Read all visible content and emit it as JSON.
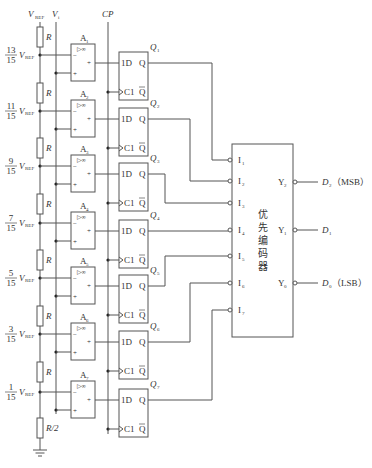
{
  "top_labels": {
    "vref": "V",
    "vref_sub": "REF",
    "vi": "V",
    "vi_sub": "i",
    "cp": "CP"
  },
  "resistor_label": "R",
  "resistor_last_label": "R/2",
  "ref_nodes": [
    {
      "num": "13",
      "den": "15",
      "v": "V",
      "sub": "REF"
    },
    {
      "num": "11",
      "den": "15",
      "v": "V",
      "sub": "REF"
    },
    {
      "num": "9",
      "den": "15",
      "v": "V",
      "sub": "REF"
    },
    {
      "num": "7",
      "den": "15",
      "v": "V",
      "sub": "REF"
    },
    {
      "num": "5",
      "den": "15",
      "v": "V",
      "sub": "REF"
    },
    {
      "num": "3",
      "den": "15",
      "v": "V",
      "sub": "REF"
    },
    {
      "num": "1",
      "den": "15",
      "v": "V",
      "sub": "REF"
    }
  ],
  "comparators": [
    {
      "name": "A",
      "sub": "1",
      "symbol": "▷∞",
      "minus": "−",
      "plus": "+",
      "out": "+"
    },
    {
      "name": "A",
      "sub": "2",
      "symbol": "▷∞",
      "minus": "−",
      "plus": "+",
      "out": "+"
    },
    {
      "name": "A",
      "sub": "3",
      "symbol": "▷∞",
      "minus": "−",
      "plus": "+",
      "out": "+"
    },
    {
      "name": "A",
      "sub": "4",
      "symbol": "▷∞",
      "minus": "−",
      "plus": "+",
      "out": "+"
    },
    {
      "name": "A",
      "sub": "5",
      "symbol": "▷∞",
      "minus": "−",
      "plus": "+",
      "out": "+"
    },
    {
      "name": "A",
      "sub": "6",
      "symbol": "▷∞",
      "minus": "−",
      "plus": "+",
      "out": "+"
    },
    {
      "name": "A",
      "sub": "7",
      "symbol": "▷∞",
      "minus": "−",
      "plus": "+",
      "out": "+"
    }
  ],
  "flipflops": [
    {
      "d": "1D",
      "q": "Q",
      "c": "C1",
      "qbar": "Q",
      "out": "Q",
      "out_sub": "1"
    },
    {
      "d": "1D",
      "q": "Q",
      "c": "C1",
      "qbar": "Q",
      "out": "Q",
      "out_sub": "2"
    },
    {
      "d": "1D",
      "q": "Q",
      "c": "C1",
      "qbar": "Q",
      "out": "Q",
      "out_sub": "3"
    },
    {
      "d": "1D",
      "q": "Q",
      "c": "C1",
      "qbar": "Q",
      "out": "Q",
      "out_sub": "4"
    },
    {
      "d": "1D",
      "q": "Q",
      "c": "C1",
      "qbar": "Q",
      "out": "Q",
      "out_sub": "5"
    },
    {
      "d": "1D",
      "q": "Q",
      "c": "C1",
      "qbar": "Q",
      "out": "Q",
      "out_sub": "6"
    },
    {
      "d": "1D",
      "q": "Q",
      "c": "C1",
      "qbar": "Q",
      "out": "Q",
      "out_sub": "7"
    }
  ],
  "encoder": {
    "title_chars": [
      "优",
      "先",
      "编",
      "码",
      "器"
    ],
    "inputs": [
      {
        "l": "I",
        "s": "1"
      },
      {
        "l": "I",
        "s": "2"
      },
      {
        "l": "I",
        "s": "3"
      },
      {
        "l": "I",
        "s": "4"
      },
      {
        "l": "I",
        "s": "5"
      },
      {
        "l": "I",
        "s": "6"
      },
      {
        "l": "I",
        "s": "7"
      }
    ],
    "outputs": [
      {
        "l": "Y",
        "s": "2",
        "d": "D",
        "ds": "2",
        "note": "（MSB）"
      },
      {
        "l": "Y",
        "s": "1",
        "d": "D",
        "ds": "1",
        "note": ""
      },
      {
        "l": "Y",
        "s": "0",
        "d": "D",
        "ds": "0",
        "note": "（LSB）"
      }
    ]
  }
}
